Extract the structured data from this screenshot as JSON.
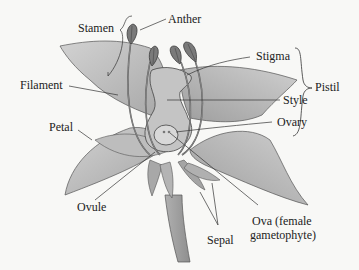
{
  "labels": {
    "stamen": "Stamen",
    "anther": "Anther",
    "filament": "Filament",
    "petal": "Petal",
    "stigma": "Stigma",
    "style": "Style",
    "pistil": "Pistil",
    "ovary": "Ovary",
    "ovule": "Ovule",
    "sepal": "Sepal",
    "ova_line1": "Ova (female",
    "ova_line2": "gametophyte)"
  },
  "colors": {
    "background": "#f8f8f6",
    "petal_fill": "#b8b8b8",
    "petal_light": "#d4d4d4",
    "anther_fill": "#7a7a7a",
    "outline": "#444444",
    "leader_line": "#333333",
    "text": "#222222"
  }
}
